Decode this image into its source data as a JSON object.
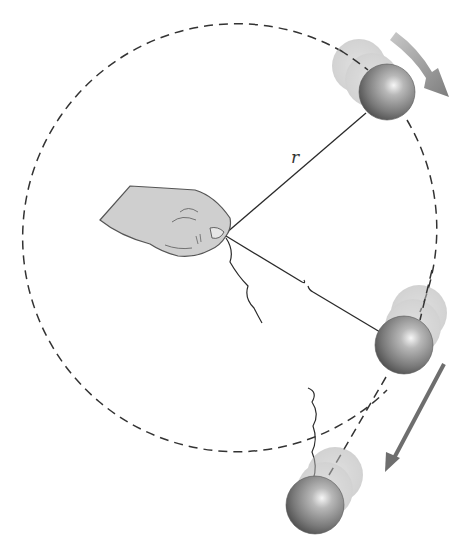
{
  "figure": {
    "labels": {
      "radius": "r"
    },
    "elements": {
      "circular_path": "dashed circular path",
      "hand": "hand holding string at center",
      "ball_top": "ball moving clockwise near top-right",
      "ball_release": "ball at moment string breaks",
      "ball_flying": "ball moving along tangent after release",
      "arrow_top": "velocity arrow tangent to circle",
      "arrow_tangent": "velocity arrow along straight-line tangent path"
    },
    "colors": {
      "ball_dark": "#4a4a4a",
      "ball_mid": "#8a8a8a",
      "ball_highlight": "#f4f4f4",
      "ghost": "#bdbdbd",
      "arrow_top": "#9a9a9a",
      "arrow_tangent": "#6e6e6e",
      "hand_fill": "#cfcfcf",
      "line": "#2a2a2a"
    }
  }
}
